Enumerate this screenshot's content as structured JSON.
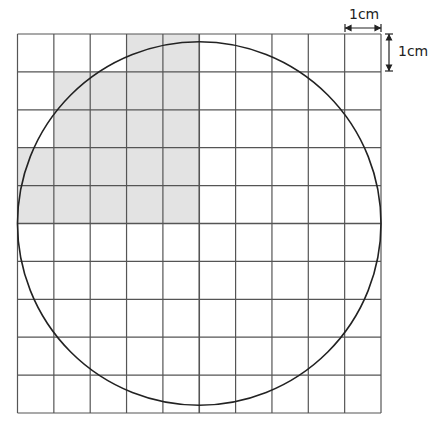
{
  "diagram": {
    "type": "grid-with-circle",
    "grid": {
      "columns": 10,
      "rows": 10,
      "cell_size_label": "1 cm",
      "line_color": "#555555"
    },
    "circle": {
      "description": "circle inscribed in the 10 x 10 grid",
      "diameter_cells": 10,
      "stroke_color": "#222222"
    },
    "shaded_cells": {
      "fill_color": "#e3e3e3",
      "cells": [
        {
          "row": 0,
          "col": 3
        },
        {
          "row": 0,
          "col": 4
        },
        {
          "row": 1,
          "col": 1
        },
        {
          "row": 1,
          "col": 2
        },
        {
          "row": 1,
          "col": 3
        },
        {
          "row": 1,
          "col": 4
        },
        {
          "row": 2,
          "col": 1
        },
        {
          "row": 2,
          "col": 2
        },
        {
          "row": 2,
          "col": 3
        },
        {
          "row": 2,
          "col": 4
        },
        {
          "row": 3,
          "col": 0
        },
        {
          "row": 3,
          "col": 1
        },
        {
          "row": 3,
          "col": 2
        },
        {
          "row": 3,
          "col": 3
        },
        {
          "row": 3,
          "col": 4
        },
        {
          "row": 4,
          "col": 0
        },
        {
          "row": 4,
          "col": 1
        },
        {
          "row": 4,
          "col": 2
        },
        {
          "row": 4,
          "col": 3
        },
        {
          "row": 4,
          "col": 4
        }
      ]
    },
    "scale_labels": {
      "horizontal": "1cm",
      "vertical": "1cm"
    }
  }
}
